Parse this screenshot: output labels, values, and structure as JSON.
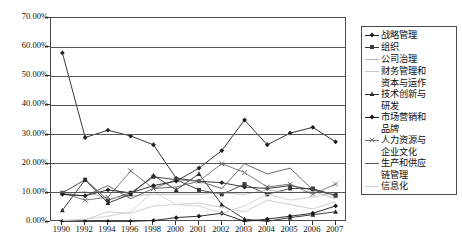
{
  "chart_data": {
    "type": "line",
    "title": "",
    "xlabel": "",
    "ylabel": "",
    "ylim": [
      0,
      70
    ],
    "ytick_labels": [
      "0.00%",
      "10.00%",
      "20.00%",
      "30.00%",
      "40.00%",
      "50.00%",
      "60.00%",
      "70.00%"
    ],
    "ytick_values": [
      0,
      10,
      20,
      30,
      40,
      50,
      60,
      70
    ],
    "grid": "horizontal",
    "legend_position": "right",
    "categories": [
      "1990",
      "1992",
      "1994",
      "1996",
      "1998",
      "2000",
      "2001",
      "2002",
      "2003",
      "2004",
      "2005",
      "2006",
      "2007"
    ],
    "series": [
      {
        "name": "战略管理",
        "color": "#222222",
        "marker": "diamond",
        "values": [
          58.0,
          29.0,
          31.5,
          29.5,
          26.5,
          15.0,
          14.0,
          13.5,
          12.0,
          11.5,
          12.5,
          11.0,
          9.5
        ]
      },
      {
        "name": "组织",
        "color": "#3a3a3a",
        "marker": "square",
        "values": [
          10.0,
          14.5,
          7.5,
          10.0,
          15.5,
          14.5,
          11.0,
          9.5,
          13.0,
          9.5,
          11.5,
          11.5,
          9.0
        ]
      },
      {
        "name": "公司治理",
        "color": "#b9b9b9",
        "marker": "none",
        "values": [
          9.5,
          10.5,
          8.0,
          9.0,
          9.5,
          9.5,
          9.5,
          10.0,
          9.5,
          11.0,
          10.0,
          10.5,
          8.0
        ]
      },
      {
        "name": "财务管理和\n资本与运作",
        "color": "#c9c9c9",
        "marker": "none",
        "values": [
          0.5,
          0.8,
          3.5,
          3.0,
          5.5,
          6.0,
          6.5,
          5.0,
          3.5,
          7.5,
          6.0,
          4.5,
          7.0
        ]
      },
      {
        "name": "技术创新与\n研发",
        "color": "#2b2b2b",
        "marker": "triangle",
        "values": [
          4.0,
          14.5,
          6.5,
          9.5,
          16.0,
          11.0,
          16.5,
          6.0,
          1.0,
          0.2,
          1.5,
          2.5,
          3.5
        ]
      },
      {
        "name": "市场营销和\n品牌",
        "color": "#1a1a1a",
        "marker": "diamond",
        "values": [
          0.2,
          0.2,
          0.2,
          0.2,
          0.5,
          1.5,
          2.0,
          3.0,
          0.2,
          1.0,
          2.0,
          3.0,
          5.5
        ]
      },
      {
        "name": "人力资源与\n企业文化",
        "color": "#6f6f6f",
        "marker": "cross",
        "values": [
          10.0,
          7.5,
          8.5,
          17.5,
          11.5,
          14.5,
          14.0,
          20.0,
          17.0,
          12.0,
          13.0,
          9.5,
          13.0
        ]
      },
      {
        "name": "生产和供应\n链管理",
        "color": "#5a5a5a",
        "marker": "none",
        "values": [
          9.5,
          9.0,
          12.5,
          8.0,
          11.5,
          12.0,
          14.0,
          11.5,
          20.0,
          16.5,
          18.5,
          11.0,
          9.0
        ]
      },
      {
        "name": "信息化",
        "color": "#d0d0d0",
        "marker": "none",
        "values": [
          0.5,
          1.0,
          2.0,
          3.5,
          10.5,
          6.0,
          5.5,
          3.0,
          5.5,
          9.5,
          7.5,
          8.5,
          10.0
        ]
      },
      {
        "name": "趋势线",
        "color": "#1c1c1c",
        "marker": "diamond",
        "values": [
          9.5,
          9.0,
          11.0,
          10.0,
          12.5,
          14.0,
          18.5,
          24.5,
          35.0,
          26.5,
          30.5,
          32.5,
          27.5
        ]
      }
    ]
  }
}
